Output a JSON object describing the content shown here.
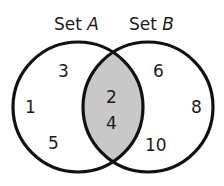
{
  "diagram": {
    "type": "venn",
    "sets": [
      {
        "id": "A",
        "label_prefix": "Set ",
        "label_var": "A",
        "only_elements": [
          "3",
          "1",
          "5"
        ]
      },
      {
        "id": "B",
        "label_prefix": "Set ",
        "label_var": "B",
        "only_elements": [
          "6",
          "8",
          "10"
        ]
      }
    ],
    "intersection": {
      "elements": [
        "2",
        "4"
      ],
      "fill_color": "#c8c8c8"
    },
    "colors": {
      "stroke": "#111111",
      "text": "#1a1a1a",
      "background": "#ffffff"
    }
  }
}
